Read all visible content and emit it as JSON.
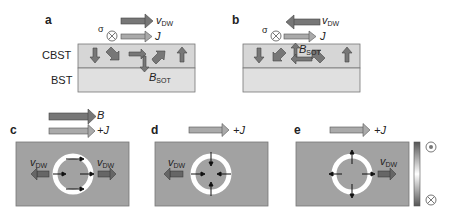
{
  "panels": {
    "a": {
      "label": "a",
      "vdw": "v",
      "vdw_sub": "DW",
      "sigma": "σ",
      "j": "J",
      "layer_top": "CBST",
      "layer_bottom": "BST",
      "bsot": "B",
      "bsot_sub": "SOT"
    },
    "b": {
      "label": "b",
      "vdw": "v",
      "vdw_sub": "DW",
      "sigma": "σ",
      "j": "J",
      "bsot": "B",
      "bsot_sub": "SOT"
    },
    "c": {
      "label": "c",
      "b": "B",
      "j": "+J",
      "vdw_left": "v",
      "vdw_left_sub": "DW",
      "vdw_right": "v",
      "vdw_right_sub": "DW"
    },
    "d": {
      "label": "d",
      "j": "+J",
      "vdw": "v",
      "vdw_sub": "DW"
    },
    "e": {
      "label": "e",
      "j": "+J",
      "vdw": "v",
      "vdw_sub": "DW",
      "colorbar_top": "⊙",
      "colorbar_bottom": "⊗"
    }
  },
  "colors": {
    "dark_arrow": "#7a7a7a",
    "light_arrow": "#a8a8a8",
    "layer_top": "#d4d4d4",
    "layer_bottom": "#dedede",
    "film": "#a0a0a0"
  }
}
